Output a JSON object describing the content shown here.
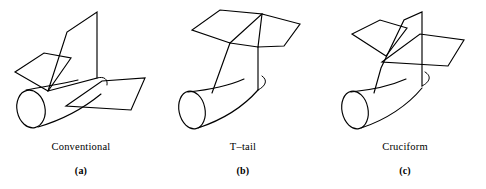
{
  "figure": {
    "background_color": "#ffffff",
    "ink_color": "#000000",
    "panels": [
      {
        "id": "conventional",
        "name": "Conventional",
        "tag": "(a)",
        "description": "Aircraft aft fuselage with vertical fin and low-mounted horizontal stabilizer attached at the fuselage"
      },
      {
        "id": "t-tail",
        "name": "T–tail",
        "tag": "(b)",
        "description": "Aircraft aft fuselage with vertical fin carrying the horizontal stabilizer at the fin tip"
      },
      {
        "id": "cruciform",
        "name": "Cruciform",
        "tag": "(c)",
        "description": "Aircraft aft fuselage with horizontal stabilizer mounted part-way up the vertical fin"
      }
    ]
  }
}
